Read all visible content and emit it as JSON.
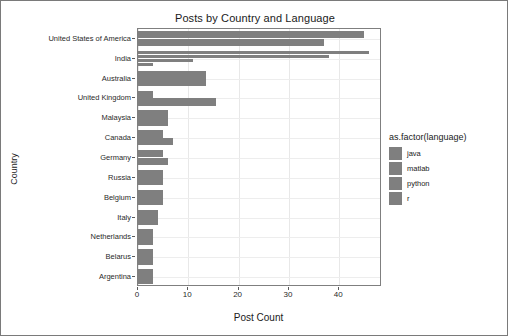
{
  "chart_data": {
    "type": "bar",
    "orientation": "horizontal",
    "grouped": true,
    "title": "Posts by Country and Language",
    "xlabel": "Post Count",
    "ylabel": "Country",
    "xlim": [
      0,
      48.5
    ],
    "xticks": [
      0,
      10,
      20,
      30,
      40
    ],
    "xticklabels": [
      "0",
      "10",
      "20",
      "30",
      "40"
    ],
    "grid": true,
    "legend": {
      "title": "as.factor(language)",
      "position": "right",
      "entries": [
        {
          "label": "java",
          "color": "#7f7f7f"
        },
        {
          "label": "matlab",
          "color": "#7f7f7f"
        },
        {
          "label": "python",
          "color": "#7f7f7f"
        },
        {
          "label": "r",
          "color": "#7f7f7f"
        }
      ]
    },
    "categories": [
      "United States of America",
      "India",
      "Australia",
      "United Kingdom",
      "Malaysia",
      "Canada",
      "Germany",
      "Russia",
      "Belgium",
      "Italy",
      "Netherlands",
      "Belarus",
      "Argentina"
    ],
    "series": [
      {
        "name": "java",
        "color": "#7f7f7f",
        "values": [
          45,
          46,
          0,
          0,
          0,
          0,
          0,
          0,
          0,
          0,
          0,
          0,
          0
        ]
      },
      {
        "name": "matlab",
        "color": "#7f7f7f",
        "values": [
          37,
          38,
          13.5,
          3,
          0,
          5,
          5,
          0,
          0,
          0,
          0,
          0,
          0
        ]
      },
      {
        "name": "python",
        "color": "#7f7f7f",
        "values": [
          0,
          11,
          0,
          15.5,
          6,
          7,
          6,
          5,
          5,
          4,
          3,
          3,
          3
        ]
      },
      {
        "name": "r",
        "color": "#7f7f7f",
        "values": [
          0,
          3,
          0,
          0,
          0,
          0,
          0,
          0,
          0,
          0,
          0,
          0,
          0
        ]
      }
    ],
    "bars": [
      {
        "category": "United States of America",
        "series": "java",
        "value": 45
      },
      {
        "category": "United States of America",
        "series": "matlab",
        "value": 37
      },
      {
        "category": "India",
        "series": "java",
        "value": 46
      },
      {
        "category": "India",
        "series": "matlab",
        "value": 38
      },
      {
        "category": "India",
        "series": "python",
        "value": 11
      },
      {
        "category": "India",
        "series": "r",
        "value": 3
      },
      {
        "category": "Australia",
        "series": "matlab",
        "value": 13.5
      },
      {
        "category": "United Kingdom",
        "series": "matlab",
        "value": 3
      },
      {
        "category": "United Kingdom",
        "series": "python",
        "value": 15.5
      },
      {
        "category": "Malaysia",
        "series": "python",
        "value": 6
      },
      {
        "category": "Canada",
        "series": "matlab",
        "value": 5
      },
      {
        "category": "Canada",
        "series": "python",
        "value": 7
      },
      {
        "category": "Germany",
        "series": "matlab",
        "value": 5
      },
      {
        "category": "Germany",
        "series": "python",
        "value": 6
      },
      {
        "category": "Russia",
        "series": "python",
        "value": 5
      },
      {
        "category": "Belgium",
        "series": "python",
        "value": 5
      },
      {
        "category": "Italy",
        "series": "python",
        "value": 4
      },
      {
        "category": "Netherlands",
        "series": "python",
        "value": 3
      },
      {
        "category": "Belarus",
        "series": "python",
        "value": 3
      },
      {
        "category": "Argentina",
        "series": "python",
        "value": 3
      }
    ]
  },
  "colors": {
    "bar": "#7f7f7f",
    "panel_border": "#7f7f7f",
    "grid_major": "#e8e8e8",
    "figure_border": "#7a7a7a",
    "text": "#1a1a1a"
  }
}
